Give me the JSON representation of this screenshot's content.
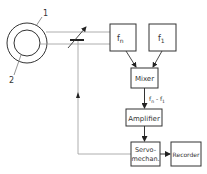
{
  "diagram": {
    "labels": {
      "ring_outer": "1",
      "ring_inner": "2"
    },
    "blocks": {
      "fn": "fn",
      "f1": "f1",
      "mixer": "Mixer",
      "amplifier": "Amplifier",
      "servo_line1": "Servo-",
      "servo_line2": "mechan.",
      "recorder": "Recorder"
    },
    "signal_label": "fn − f1",
    "colors": {
      "stroke": "#333333",
      "light_line": "#9a9a9a",
      "background": "#ffffff"
    }
  }
}
